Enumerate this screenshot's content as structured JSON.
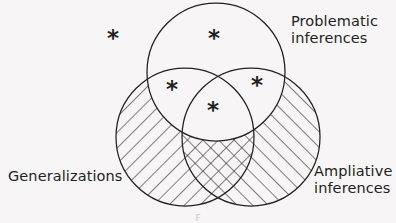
{
  "figure": {
    "type": "venn-diagram-3-set",
    "background_color": "#f7f5f6",
    "stroke_color": "#231f20",
    "caption_stub": "F"
  },
  "labels": {
    "problematic": {
      "line1": "Problematic",
      "line2": "inferences"
    },
    "generalizations": {
      "line1": "Generalizations"
    },
    "ampliative": {
      "line1": "Ampliative",
      "line2": "inferences"
    }
  },
  "sets": [
    {
      "id": "problematic-inferences",
      "name": "Problematic inferences",
      "cx": 216,
      "cy": 72,
      "r": 69,
      "hatched": false,
      "hatch_direction": "none"
    },
    {
      "id": "generalizations",
      "name": "Generalizations",
      "cx": 185,
      "cy": 137,
      "r": 69,
      "hatched": true,
      "hatch_direction": "backslash"
    },
    {
      "id": "ampliative-inferences",
      "name": "Ampliative inferences",
      "cx": 251,
      "cy": 137,
      "r": 69,
      "hatched": true,
      "hatch_direction": "forwardslash"
    }
  ],
  "markers": [
    {
      "id": "marker-outside",
      "glyph": "*",
      "x": 113,
      "y": 38,
      "region": "outside-all-sets"
    },
    {
      "id": "marker-problematic",
      "glyph": "*",
      "x": 214,
      "y": 38,
      "region": "problematic-only"
    },
    {
      "id": "marker-prob-gen",
      "glyph": "*",
      "x": 172,
      "y": 89,
      "region": "problematic-and-generalizations"
    },
    {
      "id": "marker-prob-amp",
      "glyph": "*",
      "x": 257,
      "y": 85,
      "region": "problematic-and-ampliative"
    },
    {
      "id": "marker-center",
      "glyph": "*",
      "x": 213,
      "y": 110,
      "region": "all-three-sets"
    }
  ],
  "label_positions": {
    "problematic": {
      "x": 291,
      "y": 26,
      "line_height": 17
    },
    "generalizations": {
      "x": 8,
      "y": 181
    },
    "ampliative": {
      "x": 314,
      "y": 176,
      "line_height": 17
    }
  }
}
